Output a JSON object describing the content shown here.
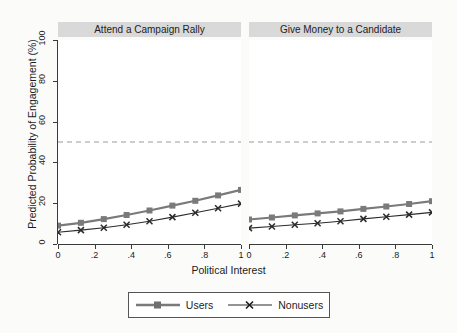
{
  "chart_data": {
    "type": "line",
    "title": "",
    "xlabel": "Political Interest",
    "ylabel": "Predicted Probability of Engagement (%)",
    "xlim": [
      0,
      1
    ],
    "ylim": [
      0,
      100
    ],
    "xticks": [
      "0",
      ".2",
      ".4",
      ".6",
      ".8",
      "1"
    ],
    "xtick_values": [
      0,
      0.2,
      0.4,
      0.6,
      0.8,
      1
    ],
    "yticks": [
      "0",
      "20",
      "40",
      "60",
      "80",
      "100"
    ],
    "ytick_values": [
      0,
      20,
      40,
      60,
      80,
      100
    ],
    "grid": false,
    "legend_position": "bottom",
    "reference_line": {
      "axis": "y",
      "value": 50,
      "style": "dashed",
      "color": "#9a9a9a"
    },
    "x": [
      0,
      0.125,
      0.25,
      0.375,
      0.5,
      0.625,
      0.75,
      0.875,
      1
    ],
    "panels": [
      {
        "label": "Attend a Campaign Rally",
        "series": [
          {
            "name": "Users",
            "values": [
              9.0,
              10.4,
              12.2,
              14.2,
              16.4,
              18.8,
              21.2,
              23.8,
              26.5
            ]
          },
          {
            "name": "Nonusers",
            "values": [
              5.8,
              6.8,
              8.0,
              9.4,
              11.2,
              13.2,
              15.3,
              17.5,
              19.8
            ]
          }
        ]
      },
      {
        "label": "Give Money to a Candidate",
        "series": [
          {
            "name": "Users",
            "values": [
              12.0,
              13.0,
              14.0,
              15.0,
              16.0,
              17.2,
              18.4,
              19.6,
              21.0
            ]
          },
          {
            "name": "Nonusers",
            "values": [
              7.8,
              8.6,
              9.4,
              10.2,
              11.2,
              12.3,
              13.4,
              14.4,
              15.5
            ]
          }
        ]
      }
    ],
    "legend": [
      {
        "name": "Users",
        "marker": "square",
        "color": "#7a7a7a"
      },
      {
        "name": "Nonusers",
        "marker": "x",
        "color": "#2b2b2b"
      }
    ]
  }
}
